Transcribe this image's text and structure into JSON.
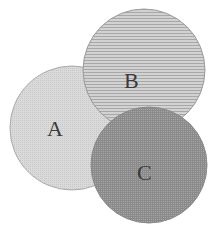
{
  "diagram": {
    "type": "venn",
    "circles": [
      {
        "id": "A",
        "label": "A",
        "cx": 72,
        "cy": 128,
        "r": 62,
        "fill": "#d6d6d6",
        "pattern": "fine-dots",
        "label_x": 55,
        "label_y": 135
      },
      {
        "id": "B",
        "label": "B",
        "cx": 144,
        "cy": 70,
        "r": 61,
        "fill": "#c3c3c3",
        "pattern": "horizontal-lines",
        "label_x": 132,
        "label_y": 87
      },
      {
        "id": "C",
        "label": "C",
        "cx": 149,
        "cy": 165,
        "r": 58,
        "fill": "#9a9a9a",
        "pattern": "crosshatch",
        "label_x": 145,
        "label_y": 180
      }
    ],
    "stroke": "#9c9c9c"
  }
}
